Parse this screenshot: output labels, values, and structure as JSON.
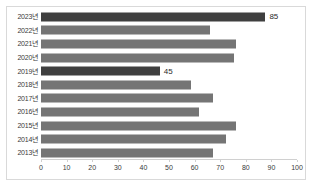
{
  "chart_data": {
    "type": "bar",
    "orientation": "horizontal",
    "title": "",
    "xlabel": "",
    "ylabel": "",
    "xlim": [
      0,
      100
    ],
    "xticks": [
      0,
      10,
      20,
      30,
      40,
      50,
      60,
      70,
      80,
      90,
      100
    ],
    "grid": false,
    "legend": false,
    "categories": [
      "2023년",
      "2022년",
      "2021년",
      "2020년",
      "2019년",
      "2018년",
      "2017년",
      "2016년",
      "2015년",
      "2014년",
      "2013년"
    ],
    "values": [
      85,
      64,
      74,
      73,
      45,
      57,
      65,
      60,
      74,
      70,
      65
    ],
    "data_labels": [
      {
        "category": "2023년",
        "value": 85,
        "text": "85"
      },
      {
        "category": "2019년",
        "value": 45,
        "text": "45"
      }
    ],
    "highlighted": [
      "2023년",
      "2019년"
    ],
    "colors": {
      "bar": "#757575",
      "bar_highlight": "#3f3f3f",
      "background": "#ffffff",
      "frame": "#d9d9d9",
      "axis": "#d0d0d0",
      "text": "#3a3a3a"
    }
  }
}
